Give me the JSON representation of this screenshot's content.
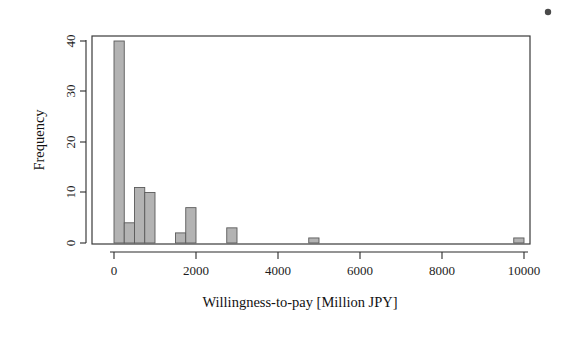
{
  "figure": {
    "background_color": "#ffffff",
    "bar_fill_color": "#b3b3b3",
    "bar_border_color": "#5a5a5a",
    "axis_color": "#2b2b2b"
  },
  "axes": {
    "x_title": "Willingness-to-pay [Million JPY]",
    "y_title": "Frequency",
    "x_ticks": [
      "0",
      "2000",
      "4000",
      "6000",
      "8000",
      "10000"
    ],
    "y_ticks": [
      "0",
      "10",
      "20",
      "30",
      "40"
    ]
  },
  "artifact": {
    "speck_label": "scan-speck"
  },
  "chart_data": {
    "type": "bar",
    "title": "",
    "subtitle": "",
    "xlabel": "Willingness-to-pay [Million JPY]",
    "ylabel": "Frequency",
    "xlim": [
      0,
      10000
    ],
    "ylim": [
      0,
      41
    ],
    "xticks": [
      0,
      2000,
      4000,
      6000,
      8000,
      10000
    ],
    "yticks": [
      0,
      10,
      20,
      30,
      40
    ],
    "grid": false,
    "legend": null,
    "bin_width": 250,
    "bin_edges": [
      0,
      250,
      500,
      750,
      1000,
      1500,
      1750,
      2750,
      4750,
      9750
    ],
    "bars": [
      {
        "x_start": 0,
        "x_end": 250,
        "value": 40
      },
      {
        "x_start": 250,
        "x_end": 500,
        "value": 4
      },
      {
        "x_start": 500,
        "x_end": 750,
        "value": 11
      },
      {
        "x_start": 750,
        "x_end": 1000,
        "value": 10
      },
      {
        "x_start": 1500,
        "x_end": 1750,
        "value": 2
      },
      {
        "x_start": 1750,
        "x_end": 2000,
        "value": 7
      },
      {
        "x_start": 2750,
        "x_end": 3000,
        "value": 3
      },
      {
        "x_start": 4750,
        "x_end": 5000,
        "value": 1
      },
      {
        "x_start": 9750,
        "x_end": 10000,
        "value": 1
      }
    ],
    "categories": [
      "0-250",
      "250-500",
      "500-750",
      "750-1000",
      "1500-1750",
      "1750-2000",
      "2750-3000",
      "4750-5000",
      "9750-10000"
    ],
    "values": [
      40,
      4,
      11,
      10,
      2,
      7,
      3,
      1,
      1
    ],
    "total_count": 79
  }
}
